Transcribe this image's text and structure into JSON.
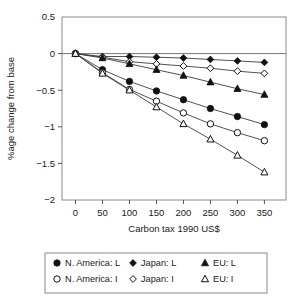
{
  "chart_data": {
    "type": "line",
    "title": "",
    "xlabel": "Carbon tax 1990 US$",
    "ylabel": "%age change from base",
    "x": [
      0,
      50,
      100,
      150,
      200,
      250,
      300,
      350
    ],
    "xticklabels": [
      "0",
      "50",
      "100",
      "150",
      "200",
      "250",
      "300",
      "350"
    ],
    "yticklabels": [
      "0.5",
      "0",
      "-0.5",
      "-1",
      "-1.5",
      "-2"
    ],
    "yticks": [
      0.5,
      0,
      -0.5,
      -1,
      -1.5,
      -2
    ],
    "xlim": [
      -25,
      390
    ],
    "ylim": [
      -2,
      0.5
    ],
    "grid": false,
    "legend_position": "below",
    "series": [
      {
        "name": "N. America: L",
        "marker": "filled-circle",
        "values": [
          0,
          -0.22,
          -0.38,
          -0.51,
          -0.63,
          -0.75,
          -0.86,
          -0.97
        ]
      },
      {
        "name": "N. America: I",
        "marker": "open-circle",
        "values": [
          0,
          -0.26,
          -0.49,
          -0.65,
          -0.81,
          -0.96,
          -1.08,
          -1.19
        ]
      },
      {
        "name": "Japan: L",
        "marker": "filled-diamond",
        "values": [
          0,
          -0.04,
          -0.04,
          -0.05,
          -0.06,
          -0.08,
          -0.1,
          -0.12
        ]
      },
      {
        "name": "Japan: I",
        "marker": "open-diamond",
        "values": [
          0,
          -0.05,
          -0.11,
          -0.14,
          -0.17,
          -0.2,
          -0.24,
          -0.27
        ]
      },
      {
        "name": "EU: L",
        "marker": "filled-triangle",
        "values": [
          0,
          -0.06,
          -0.14,
          -0.22,
          -0.3,
          -0.39,
          -0.48,
          -0.56
        ]
      },
      {
        "name": "EU: I",
        "marker": "open-triangle",
        "values": [
          0,
          -0.27,
          -0.5,
          -0.73,
          -0.96,
          -1.17,
          -1.39,
          -1.62
        ]
      }
    ]
  },
  "legend": {
    "entries": [
      {
        "label": "N. America: L",
        "marker": "filled-circle"
      },
      {
        "label": "Japan: L",
        "marker": "filled-diamond"
      },
      {
        "label": "EU: L",
        "marker": "filled-triangle"
      },
      {
        "label": "N. America: I",
        "marker": "open-circle"
      },
      {
        "label": "Japan: I",
        "marker": "open-diamond"
      },
      {
        "label": "EU: I",
        "marker": "open-triangle"
      }
    ]
  },
  "colors": {
    "line": "#3d3d3d",
    "marker_fill": "#111111",
    "marker_open_fill": "#ffffff",
    "frame": "#8a8a8a",
    "text": "#1a1a1a"
  }
}
